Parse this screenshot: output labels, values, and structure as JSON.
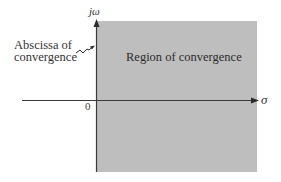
{
  "diagram": {
    "type": "s-plane region of convergence",
    "colors": {
      "region_fill": "#bebebe",
      "axis": "#3a3a3a",
      "text": "#2c2c2c",
      "background": "#ffffff"
    },
    "labels": {
      "vertical_axis": "jω",
      "horizontal_axis": "σ",
      "origin": "0",
      "region": "Region of convergence",
      "abscissa_line1": "Abscissa of",
      "abscissa_line2": "convergence"
    }
  }
}
